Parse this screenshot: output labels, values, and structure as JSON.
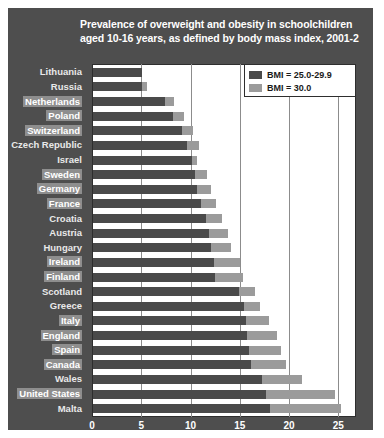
{
  "title": {
    "line1": "Prevalence of overweight and obesity in schoolchildren",
    "line2": "aged 10-16 years, as defined by body mass index, 2001-2"
  },
  "legend": {
    "items": [
      {
        "label": "BMI = 25.0-29.9",
        "color": "#4a4a4a"
      },
      {
        "label": "BMI = 30.0",
        "color": "#9b9b9b"
      }
    ]
  },
  "axis": {
    "ticks": [
      "0",
      "5",
      "10",
      "15",
      "20",
      "25"
    ],
    "tick_values": [
      0,
      5,
      10,
      15,
      20,
      25
    ],
    "xmin": 0,
    "xmax": 26.8
  },
  "colors": {
    "panel": "#4e4e4e",
    "plot_background": "#ffffff",
    "overweight": "#4a4a4a",
    "obese": "#9b9b9b",
    "label_highlight": "#8e8e8e",
    "gridline": "#8c8c8c"
  },
  "chart_data": {
    "type": "bar",
    "orientation": "horizontal",
    "stacked": true,
    "title": "Prevalence of overweight and obesity in schoolchildren aged 10-16 years, as defined by body mass index, 2001-2",
    "xlabel": "",
    "ylabel": "",
    "xlim": [
      0,
      26.8
    ],
    "grid": true,
    "legend_position": "top-right",
    "categories": [
      "Lithuania",
      "Russia",
      "Netherlands",
      "Poland",
      "Switzerland",
      "Czech Republic",
      "Israel",
      "Sweden",
      "Germany",
      "France",
      "Croatia",
      "Austria",
      "Hungary",
      "Ireland",
      "Finland",
      "Scotland",
      "Greece",
      "Italy",
      "England",
      "Spain",
      "Canada",
      "Wales",
      "United States",
      "Malta"
    ],
    "series": [
      {
        "name": "BMI = 25.0-29.9",
        "color": "#4a4a4a",
        "values": [
          5.0,
          5.0,
          7.3,
          8.1,
          9.0,
          9.5,
          10.0,
          10.4,
          10.6,
          11.0,
          11.5,
          11.8,
          12.0,
          12.3,
          12.4,
          14.8,
          15.3,
          15.5,
          15.6,
          15.8,
          16.0,
          17.2,
          17.6,
          18.0
        ]
      },
      {
        "name": "BMI = 30.0",
        "color": "#9b9b9b",
        "values": [
          0.0,
          0.5,
          0.9,
          1.1,
          1.2,
          1.3,
          0.6,
          1.2,
          1.4,
          1.5,
          1.6,
          1.9,
          2.0,
          2.6,
          2.8,
          1.6,
          1.7,
          2.4,
          3.1,
          3.3,
          3.6,
          4.0,
          7.0,
          7.2
        ]
      }
    ],
    "totals": [
      5.0,
      5.5,
      8.2,
      9.2,
      10.2,
      10.8,
      10.6,
      11.6,
      12.0,
      12.5,
      13.1,
      13.7,
      14.0,
      14.9,
      15.2,
      16.4,
      17.0,
      17.9,
      18.7,
      19.1,
      19.6,
      21.2,
      24.6,
      25.2
    ],
    "highlighted_categories": [
      "Netherlands",
      "Poland",
      "Switzerland",
      "Sweden",
      "Germany",
      "France",
      "Ireland",
      "Finland",
      "Italy",
      "England",
      "Spain",
      "Canada",
      "United States"
    ]
  }
}
